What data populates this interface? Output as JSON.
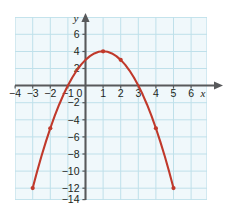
{
  "figure": {
    "kind": "coordinate-grid-graph",
    "background_color": "#ffffff",
    "grid_fill_color": "#f0f8fb",
    "grid_line_color": "#bfe0ea",
    "axis_color": "#58595b",
    "curve_color": "#c0392b",
    "point_color": "#c0392b",
    "label_color": "#231f20"
  },
  "axes": {
    "x_axis_name": "x",
    "y_axis_name": "y",
    "x_tick_labels": [
      "−4",
      "−3",
      "−2",
      "−1",
      "0",
      "1",
      "2",
      "3",
      "4",
      "5",
      "6"
    ],
    "x_tick_values": [
      -4,
      -3,
      -2,
      -1,
      0,
      1,
      2,
      3,
      4,
      5,
      6
    ],
    "y_tick_labels": [
      "6",
      "4",
      "2",
      "−2",
      "−4",
      "−6",
      "−8",
      "−10",
      "−12",
      "−14"
    ],
    "y_tick_values": [
      6,
      4,
      2,
      -2,
      -4,
      -6,
      -8,
      -10,
      -12,
      -14
    ],
    "x_range": [
      -4.6,
      6.6
    ],
    "y_range": [
      -14.8,
      7.2
    ],
    "grid_step_x": 1,
    "grid_step_y": 2,
    "has_arrow_x_positive": true,
    "has_arrow_y_positive": true,
    "grid_visible": true
  },
  "chart_data": {
    "type": "line",
    "title": "",
    "xlabel": "x",
    "ylabel": "y",
    "xlim": [
      -4.6,
      6.6
    ],
    "ylim": [
      -14.8,
      7.2
    ],
    "grid": true,
    "legend": null,
    "series": [
      {
        "name": "y = -x^2 + 2x + 3",
        "kind": "parabola",
        "color": "#c0392b",
        "opens": "down",
        "vertex": [
          1,
          4
        ],
        "x_intercepts": [
          -1,
          3
        ],
        "y_intercept": 3,
        "marked_points": [
          {
            "x": -3,
            "y": -12
          },
          {
            "x": -2,
            "y": -5
          },
          {
            "x": 1,
            "y": 4
          },
          {
            "x": 2,
            "y": 3
          },
          {
            "x": 4,
            "y": -5
          },
          {
            "x": 5,
            "y": -12
          }
        ],
        "curve_domain": [
          -3,
          5
        ],
        "x": [
          -3,
          -2.75,
          -2.5,
          -2.25,
          -2,
          -1.75,
          -1.5,
          -1.25,
          -1,
          -0.75,
          -0.5,
          -0.25,
          0,
          0.25,
          0.5,
          0.75,
          1,
          1.25,
          1.5,
          1.75,
          2,
          2.25,
          2.5,
          2.75,
          3,
          3.25,
          3.5,
          3.75,
          4,
          4.25,
          4.5,
          4.75,
          5
        ],
        "values": [
          -12,
          -10.0625,
          -8.25,
          -6.5625,
          -5,
          -3.5625,
          -2.25,
          -1.0625,
          0,
          0.9375,
          1.75,
          2.4375,
          3,
          3.4375,
          3.75,
          3.9375,
          4,
          3.9375,
          3.75,
          3.4375,
          3,
          2.4375,
          1.75,
          0.9375,
          0,
          -1.0625,
          -2.25,
          -3.5625,
          -5,
          -6.5625,
          -8.25,
          -10.0625,
          -12
        ]
      }
    ]
  }
}
